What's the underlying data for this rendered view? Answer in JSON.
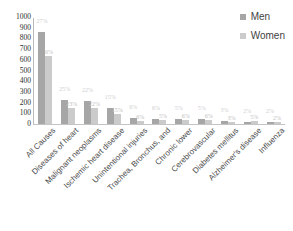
{
  "chart_data": {
    "type": "bar",
    "title": "",
    "xlabel": "",
    "ylabel": "",
    "ylim": [
      0,
      1000
    ],
    "yticks": [
      "1000",
      "900",
      "800",
      "700",
      "600",
      "500",
      "400",
      "300",
      "200",
      "100",
      "0"
    ],
    "grid": false,
    "legend_position": "top-right",
    "categories": [
      "All Causes",
      "Diseases of heart",
      "Malignant neoplasms",
      "Ischemic heart disease",
      "Unintentional injuries",
      "Trachea, Bronchus, and",
      "Chronic lower",
      "Cerebrovascular",
      "Diabetes mellitus",
      "Alzheimer's disease",
      "Influenza"
    ],
    "series": [
      {
        "name": "Men",
        "color": "#a6a6a6",
        "values": [
          870,
          225,
          215,
          150,
          55,
          50,
          48,
          45,
          28,
          20,
          22
        ],
        "labels": [
          "27%",
          "25%",
          "22%",
          "15%",
          "6%",
          "6%",
          "5%",
          "5%",
          "3%",
          "2%",
          "2%"
        ]
      },
      {
        "name": "Women",
        "color": "#cbcbcb",
        "values": [
          640,
          150,
          152,
          95,
          30,
          38,
          42,
          40,
          22,
          30,
          20
        ],
        "labels": [
          "6%",
          "23%",
          "22%",
          "15%",
          "6%",
          "5%",
          "6%",
          "6%",
          "3%",
          "5%",
          "2%"
        ]
      }
    ]
  },
  "legend": {
    "items": [
      {
        "label": "Men",
        "color": "#a6a6a6"
      },
      {
        "label": "Women",
        "color": "#cbcbcb"
      }
    ]
  }
}
